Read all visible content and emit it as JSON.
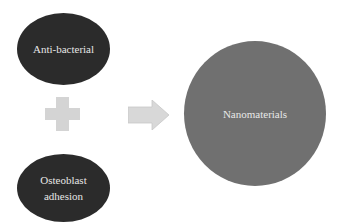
{
  "diagram": {
    "nodes": [
      {
        "id": "anti-bacterial",
        "label": "Anti-bacterial",
        "fill": "#2b2b2b"
      },
      {
        "id": "osteoblast-adhesion",
        "label_lines": [
          "Osteoblast",
          "adhesion"
        ],
        "fill": "#2b2b2b"
      },
      {
        "id": "nanomaterials",
        "label": "Nanomaterials",
        "fill": "#707070"
      }
    ],
    "connectors": [
      {
        "type": "plus",
        "color": "#d4d4d4"
      },
      {
        "type": "arrow-right",
        "color": "#d4d4d4"
      }
    ]
  }
}
